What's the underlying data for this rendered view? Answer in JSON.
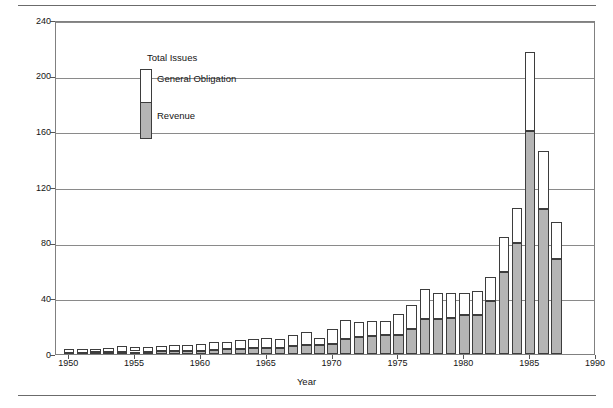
{
  "chart_data": {
    "type": "bar",
    "title": "",
    "xlabel": "Year",
    "ylabel": "Billions of Dollars",
    "ylim": [
      0,
      240
    ],
    "xlim": [
      1949,
      1990
    ],
    "yticks": [
      0,
      40,
      80,
      120,
      160,
      200,
      240
    ],
    "xticks": [
      1950,
      1955,
      1960,
      1965,
      1970,
      1975,
      1980,
      1985,
      1990
    ],
    "grid": true,
    "stacked": true,
    "legend_position": "upper-left-inside",
    "legend_title": "Total Issues",
    "categories": [
      1950,
      1951,
      1952,
      1953,
      1954,
      1955,
      1956,
      1957,
      1958,
      1959,
      1960,
      1961,
      1962,
      1963,
      1964,
      1965,
      1966,
      1967,
      1968,
      1969,
      1970,
      1971,
      1972,
      1973,
      1974,
      1975,
      1976,
      1977,
      1978,
      1979,
      1980,
      1981,
      1982,
      1983,
      1984,
      1985,
      1986,
      1987
    ],
    "series": [
      {
        "name": "Revenue",
        "color": "#b5b5b5",
        "values": [
          1.0,
          1.0,
          1.2,
          1.4,
          1.6,
          1.8,
          1.8,
          2.0,
          2.3,
          2.3,
          2.5,
          2.8,
          3.3,
          3.7,
          4.2,
          4.2,
          4.0,
          5.5,
          6.5,
          6.5,
          7.0,
          10.5,
          12.0,
          13.0,
          14.0,
          14.0,
          18.0,
          25.0,
          25.0,
          26.0,
          28.0,
          28.0,
          38.0,
          59.0,
          80.0,
          160.0,
          104.0,
          68.0
        ]
      },
      {
        "name": "General Obligation",
        "color": "#ffffff",
        "values": [
          2.5,
          2.3,
          2.3,
          3.0,
          4.4,
          3.4,
          3.2,
          3.5,
          4.3,
          4.4,
          4.5,
          5.5,
          5.2,
          6.3,
          6.5,
          7.3,
          7.0,
          8.5,
          9.5,
          5.0,
          11.0,
          14.0,
          11.0,
          10.5,
          10.0,
          15.0,
          17.0,
          22.0,
          19.0,
          17.5,
          16.0,
          17.0,
          17.0,
          25.0,
          25.0,
          57.0,
          42.0,
          27.0
        ]
      }
    ],
    "totals": [
      3.5,
      3.3,
      3.5,
      4.4,
      6.0,
      5.2,
      5.0,
      5.5,
      6.6,
      6.7,
      7.0,
      8.3,
      8.5,
      10.0,
      10.7,
      11.5,
      11.0,
      14.0,
      16.0,
      11.5,
      18.0,
      24.5,
      23.0,
      23.5,
      24.0,
      29.0,
      35.0,
      47.0,
      44.0,
      43.5,
      44.0,
      45.0,
      55.0,
      84.0,
      105.0,
      217.0,
      146.0,
      95.0
    ]
  },
  "legend": {
    "title": "Total Issues",
    "general_obligation_label": "General Obligation",
    "revenue_label": "Revenue"
  },
  "axes": {
    "ylabel": "Billions of Dollars",
    "xlabel": "Year",
    "ytick_labels": [
      "240",
      "200",
      "160",
      "120",
      "80",
      "40",
      "0"
    ],
    "xtick_labels": [
      "1950",
      "1955",
      "1960",
      "1965",
      "1970",
      "1975",
      "1980",
      "1985",
      "1990"
    ]
  }
}
